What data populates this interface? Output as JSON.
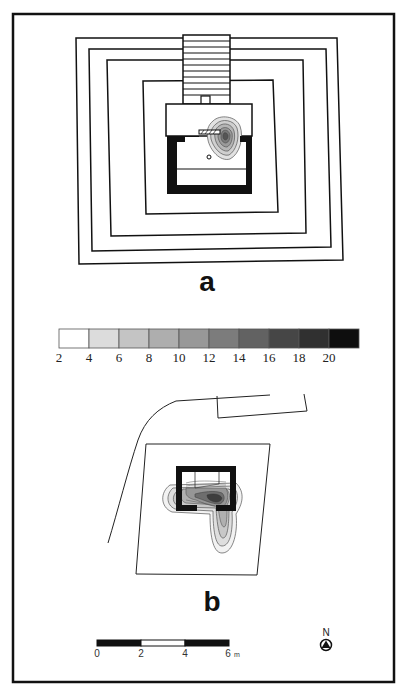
{
  "figure": {
    "panels": [
      {
        "id": "a",
        "label": "a",
        "description": "Stepped platform plan with stair and structure; concentration contours near entrance"
      },
      {
        "id": "b",
        "label": "b",
        "description": "Rectangular enclosure with U-shaped structure and contour plume extending south"
      }
    ],
    "legend": {
      "type": "graduated-scale",
      "tick_labels": [
        "2",
        "4",
        "6",
        "8",
        "10",
        "12",
        "14",
        "16",
        "18",
        "20"
      ],
      "bins": [
        {
          "from": 2,
          "to": 4,
          "color": "#ffffff"
        },
        {
          "from": 4,
          "to": 6,
          "color": "#dcdcdc"
        },
        {
          "from": 6,
          "to": 8,
          "color": "#c4c4c4"
        },
        {
          "from": 8,
          "to": 10,
          "color": "#aeaeae"
        },
        {
          "from": 10,
          "to": 12,
          "color": "#989898"
        },
        {
          "from": 12,
          "to": 14,
          "color": "#7c7c7c"
        },
        {
          "from": 14,
          "to": 16,
          "color": "#626262"
        },
        {
          "from": 16,
          "to": 18,
          "color": "#464646"
        },
        {
          "from": 18,
          "to": 20,
          "color": "#303030"
        },
        {
          "from": 20,
          "to": 22,
          "color": "#0e0e0e"
        }
      ]
    },
    "scale_bar": {
      "tick_labels": [
        "0",
        "2",
        "4",
        "6"
      ],
      "unit": "m"
    },
    "north_arrow": {
      "label": "N"
    }
  }
}
